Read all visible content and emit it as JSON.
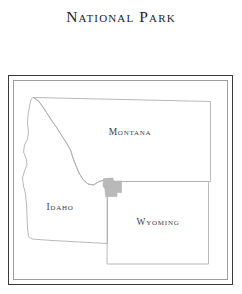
{
  "title": "National Park",
  "map": {
    "states": [
      {
        "id": "montana",
        "label": "Montana"
      },
      {
        "id": "idaho",
        "label": "Idaho"
      },
      {
        "id": "wyoming",
        "label": "Wyoming"
      }
    ],
    "park_area": {
      "name": "yellowstone-national-park",
      "fill": "#b9b9b9"
    },
    "colors": {
      "state_outline": "#b0b0b4",
      "frame_outer": "#3a3a3e",
      "frame_inner": "#9d9da2",
      "label_text": "#3f4048",
      "title_text": "#23252e",
      "background": "#ffffff"
    }
  }
}
